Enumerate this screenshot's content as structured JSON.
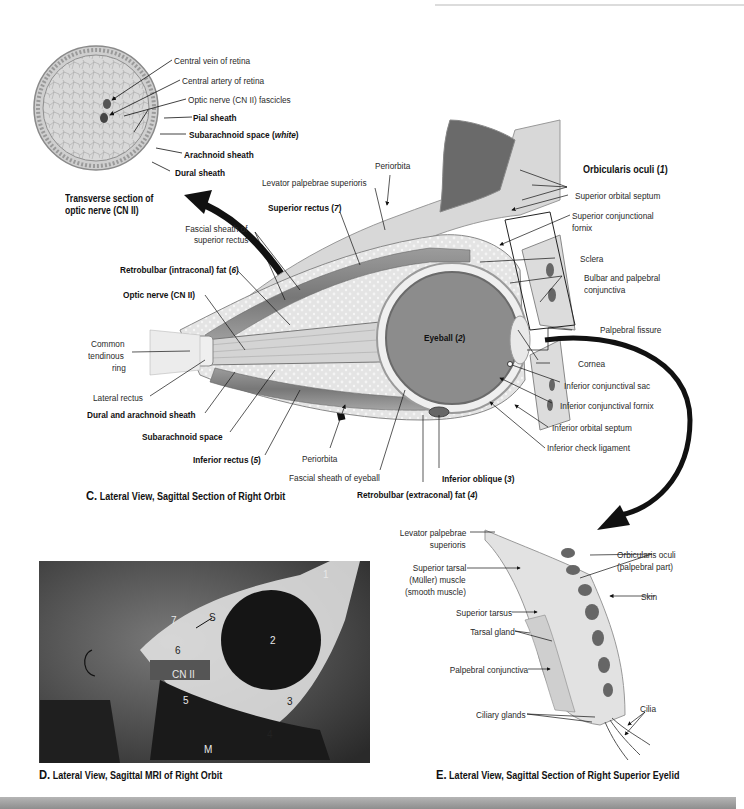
{
  "panels": {
    "transverse": {
      "caption": "Transverse section of optic nerve (CN II)",
      "caption_line1": "Transverse section of",
      "caption_line2": "optic nerve (CN II)",
      "labels": {
        "central_vein": "Central vein of retina",
        "central_artery": "Central artery of retina",
        "fascicles": "Optic nerve (CN II) fascicles",
        "pial": "Pial sheath",
        "subarachnoid": "Subarachnoid space (",
        "subarachnoid_italic": "white",
        "subarachnoid_close": ")",
        "arachnoid": "Arachnoid sheath",
        "dural": "Dural sheath"
      }
    },
    "C": {
      "letter": "C.",
      "caption": "Lateral View, Sagittal Section of Right Orbit",
      "labels": {
        "periorbita_top": "Periorbita",
        "levator": "Levator palpebrae superioris",
        "superior_rectus": "Superior rectus (",
        "superior_rectus_num": "7",
        "fascial_sheath_sr_1": "Fascial sheath of",
        "fascial_sheath_sr_2": "superior rectus",
        "retrobulbar_intraconal": "Retrobulbar (intraconal) fat (",
        "retrobulbar_intraconal_num": "6",
        "optic_nerve": "Optic nerve (CN II)",
        "common_tendinous_1": "Common",
        "common_tendinous_2": "tendinous",
        "common_tendinous_3": "ring",
        "lateral_rectus": "Lateral rectus",
        "dural_arachnoid": "Dural and arachnoid sheath",
        "subarachnoid_space": "Subarachnoid space",
        "inferior_rectus": "Inferior rectus (",
        "inferior_rectus_num": "5",
        "periorbita_bottom": "Periorbita",
        "fascial_sheath_eyeball": "Fascial sheath of eyeball",
        "retrobulbar_extraconal": "Retrobulbar (extraconal) fat (",
        "retrobulbar_extraconal_num": "4",
        "inferior_oblique": "Inferior oblique (",
        "inferior_oblique_num": "3",
        "eyeball": "Eyeball (",
        "eyeball_num": "2",
        "orbicularis": "Orbicularis oculi (",
        "orbicularis_num": "1",
        "superior_orbital_septum": "Superior orbital septum",
        "superior_conj_fornix_1": "Superior conjunctional",
        "superior_conj_fornix_2": "fornix",
        "sclera": "Sclera",
        "bulbar_palpebral_1": "Bulbar and palpebral",
        "bulbar_palpebral_2": "conjunctiva",
        "palpebral_fissure": "Palpebral fissure",
        "cornea": "Cornea",
        "inferior_conj_sac": "Inferior conjunctival sac",
        "inferior_conj_fornix": "Inferior conjunctival fornix",
        "inferior_orbital_septum": "Inferior orbital septum",
        "inferior_check_ligament": "Inferior check ligament"
      }
    },
    "D": {
      "letter": "D.",
      "caption": "Lateral View, Sagittal MRI of Right Orbit",
      "markers": {
        "m1": "1",
        "m2": "2",
        "m3": "3",
        "m4": "4",
        "m5": "5",
        "m6": "6",
        "m7": "7",
        "s": "S",
        "cn2": "CN II",
        "m": "M",
        "c": "C"
      }
    },
    "E": {
      "letter": "E.",
      "caption": "Lateral View, Sagittal Section of Right Superior Eyelid",
      "labels": {
        "levator_1": "Levator palpebrae",
        "levator_2": "superioris",
        "sup_tarsal_1": "Superior tarsal",
        "sup_tarsal_2": "(Müller) muscle",
        "sup_tarsal_3": "(smooth muscle)",
        "superior_tarsus": "Superior tarsus",
        "tarsal_gland": "Tarsal gland",
        "palpebral_conjunctiva": "Palpebral conjunctiva",
        "ciliary_glands": "Ciliary glands",
        "orbicularis_1": "Orbicularis oculi",
        "orbicularis_2": "(palpebral part)",
        "skin": "Skin",
        "cilia": "Cilia"
      }
    }
  },
  "colors": {
    "tissue_light": "#e6e6e6",
    "tissue_mid": "#bdbdbd",
    "eyeball": "#8a8a8a",
    "muscle": "#7a7a7a",
    "arrow": "#111111",
    "mri_bg": "#3a3a3a"
  }
}
